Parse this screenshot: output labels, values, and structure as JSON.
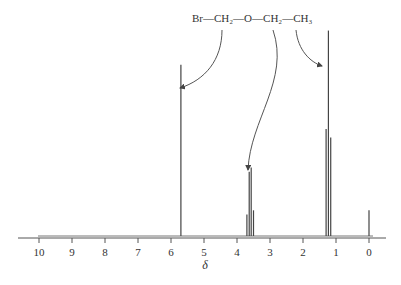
{
  "chart_data": {
    "type": "line",
    "title": "",
    "xlabel": "δ",
    "ylabel": "",
    "xlim": [
      10,
      0
    ],
    "x_ticks": [
      "10",
      "9",
      "8",
      "7",
      "6",
      "5",
      "4",
      "3",
      "2",
      "1",
      "0"
    ],
    "x_tick_values": [
      10,
      9,
      8,
      7,
      6,
      5,
      4,
      3,
      2,
      1,
      0
    ],
    "grid": false,
    "molecule": {
      "parts": [
        "Br",
        "CH₂",
        "O",
        "CH₂",
        "CH₃"
      ],
      "bond": "—"
    },
    "peaks": [
      {
        "shift": 5.7,
        "intensity": 0.8,
        "group": "Br-CH2"
      },
      {
        "shift": 3.7,
        "intensity": 0.1,
        "group": "O-CH2"
      },
      {
        "shift": 3.63,
        "intensity": 0.3,
        "group": "O-CH2"
      },
      {
        "shift": 3.57,
        "intensity": 0.32,
        "group": "O-CH2"
      },
      {
        "shift": 3.5,
        "intensity": 0.12,
        "group": "O-CH2"
      },
      {
        "shift": 1.3,
        "intensity": 0.5,
        "group": "CH3"
      },
      {
        "shift": 1.23,
        "intensity": 0.96,
        "group": "CH3"
      },
      {
        "shift": 1.16,
        "intensity": 0.46,
        "group": "CH3"
      },
      {
        "shift": 0.0,
        "intensity": 0.12,
        "group": "TMS"
      }
    ],
    "annotations": [
      {
        "from": "Br-CH2",
        "to_shift": 5.7
      },
      {
        "from": "O-CH2",
        "to_shift": 3.6
      },
      {
        "from": "CH3",
        "to_shift": 1.23
      }
    ]
  }
}
